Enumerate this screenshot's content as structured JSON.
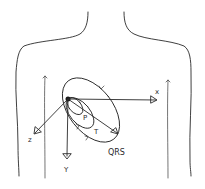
{
  "diagram": {
    "axes": [
      {
        "name": "X",
        "label": "x"
      },
      {
        "name": "Y",
        "label": "Y"
      },
      {
        "name": "Z",
        "label": "z"
      }
    ],
    "loops": [
      {
        "name": "P",
        "label": "P"
      },
      {
        "name": "T",
        "label": "T"
      },
      {
        "name": "QRS",
        "label": "QRS"
      }
    ]
  }
}
